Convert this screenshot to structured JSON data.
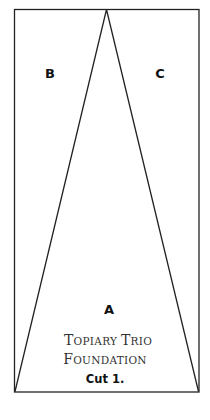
{
  "diagram": {
    "type": "quilt-foundation-pattern",
    "sections": [
      {
        "id": "B",
        "label": "B"
      },
      {
        "id": "C",
        "label": "C"
      },
      {
        "id": "A",
        "label": "A"
      }
    ],
    "title_line1_cap1": "T",
    "title_line1_rest1": "OPIARY ",
    "title_line1_cap2": "T",
    "title_line1_rest2": "RIO",
    "title_line2_cap": "F",
    "title_line2_rest": "OUNDATION",
    "instruction": "Cut 1.",
    "colors": {
      "line": "#222222",
      "background": "#ffffff"
    }
  }
}
